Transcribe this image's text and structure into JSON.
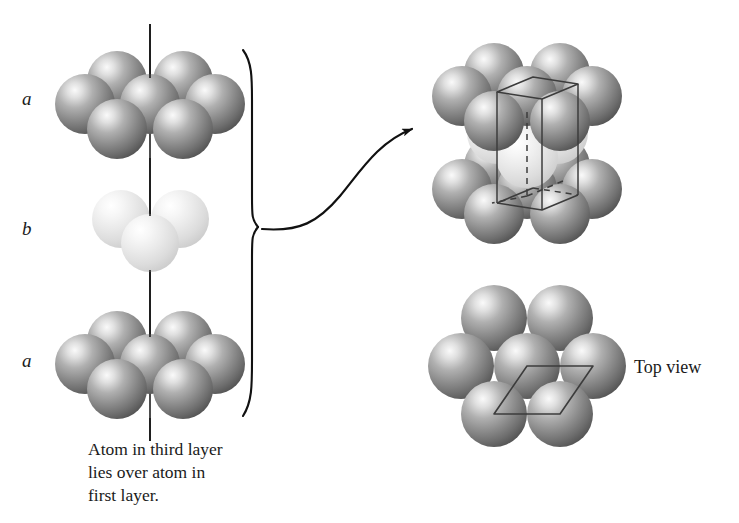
{
  "figure": {
    "width": 739,
    "height": 523,
    "background_color": "#ffffff"
  },
  "colors": {
    "sphere_dark_highlight": "#f2f2f2",
    "sphere_dark_mid": "#9a9a9a",
    "sphere_dark_edge": "#4f4f4f",
    "sphere_light_highlight": "#fdfdfd",
    "sphere_light_mid": "#e2e2e2",
    "sphere_light_edge": "#c2c2c2",
    "line": "#111111",
    "wireframe": "#3c3c3c",
    "text": "#1a1a1a"
  },
  "left_stack": {
    "name": "layer-stack-side-view",
    "axis_line": {
      "name": "vertical-axis-line",
      "x": 150,
      "y_top": 24,
      "y_bottom": 441
    },
    "layers": [
      {
        "id": "top-a",
        "label": "a",
        "label_x": 26,
        "label_y": 98,
        "shade": "dark",
        "sphere_count": 7,
        "center_x": 150,
        "center_y": 103,
        "radius": 30
      },
      {
        "id": "middle-b",
        "label": "b",
        "label_x": 26,
        "label_y": 228,
        "shade": "light",
        "sphere_count": 3,
        "center_x": 150,
        "center_y": 230,
        "radius": 30
      },
      {
        "id": "bottom-a",
        "label": "a",
        "label_x": 26,
        "label_y": 360,
        "shade": "dark",
        "sphere_count": 7,
        "center_x": 150,
        "center_y": 363,
        "radius": 30
      }
    ],
    "brace": {
      "name": "grouping-brace",
      "x": 250,
      "y_top": 50,
      "y_bottom": 416,
      "apex_y": 227
    },
    "caption": {
      "name": "stacking-caption",
      "text": "Atom in third layer\nlies over atom in\nfirst layer.",
      "x": 88,
      "y": 438
    }
  },
  "connector": {
    "name": "curved-arrow",
    "from_x": 258,
    "from_y": 228,
    "to_x": 412,
    "to_y": 128,
    "arrowhead": true
  },
  "right_panels": [
    {
      "id": "unit-cell-view",
      "name": "unit-cell-diagram",
      "center_x": 527,
      "center_y": 138,
      "label": "",
      "layers": [
        {
          "id": "uc-top-a",
          "shade": "dark",
          "sphere_count": 7,
          "center_y": 92
        },
        {
          "id": "uc-middle-b",
          "shade": "light",
          "sphere_count": 3,
          "center_y": 140
        },
        {
          "id": "uc-bottom-a",
          "shade": "dark",
          "sphere_count": 7,
          "center_y": 186
        }
      ],
      "wireframe": {
        "name": "unit-cell-wireframe",
        "shape": "parallelepiped",
        "has_hidden_dashed_edges": true,
        "stroke": "#3c3c3c"
      }
    },
    {
      "id": "top-view",
      "name": "top-view-diagram",
      "center_x": 527,
      "center_y": 365,
      "label": "Top view",
      "label_x": 634,
      "label_y": 357,
      "sphere_count": 7,
      "shade": "dark",
      "overlay": {
        "name": "rhombus-outline",
        "shape": "rhombus",
        "stroke": "#3c3c3c"
      }
    }
  ]
}
